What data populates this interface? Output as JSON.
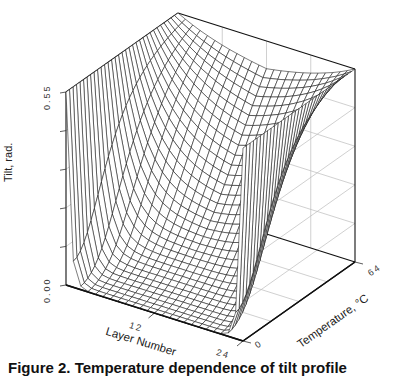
{
  "chart_data": {
    "type": "surface3d",
    "title": "",
    "xlabel": "Layer Number",
    "ylabel": "Temperature, °C",
    "zlabel": "Tilt, rad.",
    "x_ticks": [
      "12",
      "24"
    ],
    "y_ticks": [
      "0",
      "64"
    ],
    "z_ticks": [
      "0.00",
      "0.55"
    ],
    "xlim": [
      0,
      24
    ],
    "ylim": [
      0,
      64
    ],
    "zlim": [
      0,
      0.55
    ],
    "grid": true,
    "x_count": 25,
    "y_count": 33,
    "sample_profile_low_T": {
      "T": 0,
      "layers": [
        0,
        1,
        2,
        4,
        8,
        12,
        16,
        20,
        22,
        23,
        24
      ],
      "tilt": [
        0.55,
        0.08,
        0.03,
        0.01,
        0.0,
        0.0,
        0.0,
        0.01,
        0.03,
        0.08,
        0.55
      ]
    },
    "sample_profile_mid_T": {
      "T": 32,
      "layers": [
        0,
        1,
        2,
        4,
        8,
        12,
        16,
        20,
        22,
        23,
        24
      ],
      "tilt": [
        0.55,
        0.45,
        0.36,
        0.25,
        0.18,
        0.16,
        0.18,
        0.25,
        0.36,
        0.45,
        0.55
      ]
    },
    "sample_profile_high_T": {
      "T": 64,
      "layers": [
        0,
        1,
        2,
        4,
        8,
        12,
        16,
        20,
        22,
        23,
        24
      ],
      "tilt": [
        0.55,
        0.52,
        0.5,
        0.47,
        0.45,
        0.44,
        0.45,
        0.47,
        0.5,
        0.52,
        0.55
      ]
    }
  },
  "labels": {
    "z_axis": "Tilt, rad.",
    "z_tick_top": "0.55",
    "z_tick_bottom": "0.00",
    "x_axis": "Layer Number",
    "x_tick_mid": "12",
    "x_tick_end": "24",
    "y_axis": "Temperature, °C",
    "y_tick_start": "0",
    "y_tick_end": "64"
  },
  "caption": "Figure 2.  Temperature dependence of tilt profile"
}
